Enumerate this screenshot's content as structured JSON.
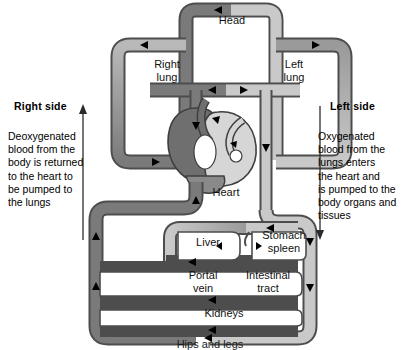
{
  "diagram": {
    "colors": {
      "deoxygenated_vessel": "#7a7a7a",
      "oxygenated_vessel": "#c9c9c9",
      "vessel_outline": "#4d4d4d",
      "heart_dark": "#6f6f6f",
      "heart_light": "#d6d6d6",
      "text": "#000000",
      "background": "#ffffff"
    },
    "annotations": {
      "right_side": {
        "heading": "Right side",
        "text": "Deoxygenated\nblood from the\nbody is returned\nto the heart to\nbe pumped to\nthe lungs",
        "arrow_direction": "up"
      },
      "left_side": {
        "heading": "Left side",
        "text": "Oxygenated\nblood from the\nlungs enters\nthe heart and\nis pumped to the\nbody organs and\ntissues",
        "arrow_direction": "down"
      }
    },
    "organs": [
      {
        "id": "head",
        "label": "Head",
        "x": 202,
        "y": 14,
        "w": 60,
        "h": 14
      },
      {
        "id": "right-lung",
        "label": "Right\nlung",
        "x": 144,
        "y": 58,
        "w": 46,
        "h": 28
      },
      {
        "id": "left-lung",
        "label": "Left\nlung",
        "x": 271,
        "y": 58,
        "w": 46,
        "h": 28
      },
      {
        "id": "heart",
        "label": "Heart",
        "x": 202,
        "y": 186,
        "w": 48,
        "h": 14
      },
      {
        "id": "liver",
        "label": "Liver",
        "x": 186,
        "y": 236,
        "w": 44,
        "h": 14
      },
      {
        "id": "stomach-spleen",
        "label": "Stomach\nspleen",
        "x": 256,
        "y": 229,
        "w": 56,
        "h": 28
      },
      {
        "id": "portal-vein",
        "label": "Portal\nvein",
        "x": 181,
        "y": 269,
        "w": 44,
        "h": 28
      },
      {
        "id": "intestinal-tract",
        "label": "Intestinal\ntract",
        "x": 239,
        "y": 269,
        "w": 58,
        "h": 28
      },
      {
        "id": "kidneys",
        "label": "Kidneys",
        "x": 195,
        "y": 307,
        "w": 58,
        "h": 14
      },
      {
        "id": "hips-and-legs",
        "label": "Hips and legs",
        "x": 165,
        "y": 338,
        "w": 90,
        "h": 12
      }
    ]
  }
}
